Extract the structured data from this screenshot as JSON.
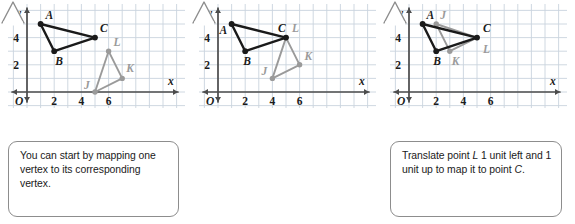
{
  "figure": {
    "axis_labels": {
      "x": "x",
      "y": "y",
      "origin": "O"
    },
    "x_ticks": [
      "2",
      "4",
      "6"
    ],
    "y_ticks": [
      "2",
      "4"
    ],
    "colors": {
      "grid": "#c9d4de",
      "axis": "#4c4c4c",
      "triangle_abc": "#1a1a1a",
      "triangle_jkl": "#9a9a9a",
      "callout_border": "#8d8d8d",
      "text": "#1a1a1a",
      "background": "#ffffff"
    },
    "axis_range": {
      "xmin": -0.6,
      "xmax": 7.7,
      "ymin": -0.6,
      "ymax": 6.0
    }
  },
  "panels": [
    {
      "id": "panel-1",
      "caption_parts": [
        {
          "text": "You can start by mapping one vertex to its corresponding vertex.",
          "style": "plain"
        }
      ],
      "caption_lines": [
        "You can start by",
        "mapping one vertex",
        "to its corresponding",
        "vertex."
      ],
      "triangles": [
        {
          "name": "ABC",
          "color": "dark",
          "vertices": [
            {
              "label": "A",
              "x": 1,
              "y": 5,
              "label_dx": 5,
              "label_dy": -5
            },
            {
              "label": "B",
              "x": 2,
              "y": 3,
              "label_dx": 1,
              "label_dy": 14
            },
            {
              "label": "C",
              "x": 5,
              "y": 4,
              "label_dx": 5,
              "label_dy": -6
            }
          ]
        },
        {
          "name": "JKL",
          "color": "gray",
          "vertices": [
            {
              "label": "J",
              "x": 5,
              "y": 0,
              "label_dx": -11,
              "label_dy": -3
            },
            {
              "label": "K",
              "x": 7,
              "y": 1,
              "label_dx": 4,
              "label_dy": -6
            },
            {
              "label": "L",
              "x": 6,
              "y": 3,
              "label_dx": 5,
              "label_dy": -5
            }
          ]
        }
      ]
    },
    {
      "id": "panel-2",
      "caption_parts": [
        {
          "text": "Translate point ",
          "style": "plain"
        },
        {
          "text": "L",
          "style": "italic"
        },
        {
          "text": " 1 unit left and 1 unit up to map it to point ",
          "style": "plain"
        },
        {
          "text": "C",
          "style": "italic"
        },
        {
          "text": ".",
          "style": "plain"
        }
      ],
      "caption_lines": [
        "Translate point L",
        "1 unit left and",
        "1 unit up to map it",
        "to point C."
      ],
      "triangles": [
        {
          "name": "ABC",
          "color": "dark",
          "vertices": [
            {
              "label": "A",
              "x": 1,
              "y": 5,
              "label_dx": -12,
              "label_dy": 10
            },
            {
              "label": "B",
              "x": 2,
              "y": 3,
              "label_dx": -2,
              "label_dy": 14
            },
            {
              "label": "C",
              "x": 5,
              "y": 4,
              "label_dx": -8,
              "label_dy": -6
            }
          ]
        },
        {
          "name": "JKL",
          "color": "gray",
          "vertices": [
            {
              "label": "J",
              "x": 4,
              "y": 1,
              "label_dx": -11,
              "label_dy": -3
            },
            {
              "label": "K",
              "x": 6,
              "y": 2,
              "label_dx": 5,
              "label_dy": -5
            },
            {
              "label": "L",
              "x": 5,
              "y": 4,
              "label_dx": 6,
              "label_dy": -6
            }
          ]
        }
      ]
    },
    {
      "id": "panel-3",
      "caption_parts": [
        {
          "text": "Rotate ",
          "style": "plain"
        },
        {
          "text": "△",
          "style": "symbol"
        },
        {
          "text": "JKL",
          "style": "italic"
        },
        {
          "text": " about point ",
          "style": "plain"
        },
        {
          "text": "L",
          "style": "italic"
        },
        {
          "text": " so that side ",
          "style": "plain"
        },
        {
          "text": "LK",
          "style": "italic"
        },
        {
          "text": " aligns with side ",
          "style": "plain"
        },
        {
          "text": "CB",
          "style": "italic"
        },
        {
          "text": ".",
          "style": "plain"
        }
      ],
      "caption_lines": [
        "Rotate △JKL about",
        "point L so that side LK",
        "aligns with side CB."
      ],
      "triangles": [
        {
          "name": "ABC",
          "color": "dark",
          "vertices": [
            {
              "label": "A",
              "x": 1,
              "y": 5,
              "label_dx": 4,
              "label_dy": -5
            },
            {
              "label": "B",
              "x": 2,
              "y": 3,
              "label_dx": -3,
              "label_dy": 14
            },
            {
              "label": "C",
              "x": 5,
              "y": 4,
              "label_dx": 6,
              "label_dy": -6
            }
          ]
        },
        {
          "name": "JKL",
          "color": "gray",
          "vertices": [
            {
              "label": "J",
              "x": 2,
              "y": 5,
              "label_dx": 4,
              "label_dy": -5
            },
            {
              "label": "K",
              "x": 3,
              "y": 3,
              "label_dx": 2,
              "label_dy": 14
            },
            {
              "label": "L",
              "x": 5,
              "y": 4,
              "label_dx": 6,
              "label_dy": 15
            }
          ]
        }
      ]
    }
  ],
  "chart_data": {
    "type": "scatter",
    "xlabel": "x",
    "ylabel": "y",
    "xlim": [
      0,
      7.7
    ],
    "ylim": [
      0,
      6
    ],
    "x_tick_values": [
      2,
      4,
      6
    ],
    "y_tick_values": [
      2,
      4
    ],
    "grid": true,
    "legend": "none",
    "series": [
      {
        "name": "Step 1 – triangle ABC",
        "points": [
          [
            1,
            5
          ],
          [
            2,
            3
          ],
          [
            5,
            4
          ]
        ],
        "labels": [
          "A",
          "B",
          "C"
        ],
        "color": "#1a1a1a"
      },
      {
        "name": "Step 1 – triangle JKL",
        "points": [
          [
            5,
            0
          ],
          [
            7,
            1
          ],
          [
            6,
            3
          ]
        ],
        "labels": [
          "J",
          "K",
          "L"
        ],
        "color": "#9a9a9a"
      },
      {
        "name": "Step 2 – triangle ABC",
        "points": [
          [
            1,
            5
          ],
          [
            2,
            3
          ],
          [
            5,
            4
          ]
        ],
        "labels": [
          "A",
          "B",
          "C"
        ],
        "color": "#1a1a1a"
      },
      {
        "name": "Step 2 – triangle JKL (translated 1 left, 1 up)",
        "points": [
          [
            4,
            1
          ],
          [
            6,
            2
          ],
          [
            5,
            4
          ]
        ],
        "labels": [
          "J",
          "K",
          "L"
        ],
        "color": "#9a9a9a"
      },
      {
        "name": "Step 3 – triangle ABC",
        "points": [
          [
            1,
            5
          ],
          [
            2,
            3
          ],
          [
            5,
            4
          ]
        ],
        "labels": [
          "A",
          "B",
          "C"
        ],
        "color": "#1a1a1a"
      },
      {
        "name": "Step 3 – triangle JKL (rotated about L)",
        "points": [
          [
            2,
            5
          ],
          [
            3,
            3
          ],
          [
            5,
            4
          ]
        ],
        "labels": [
          "J",
          "K",
          "L"
        ],
        "color": "#9a9a9a"
      }
    ]
  }
}
